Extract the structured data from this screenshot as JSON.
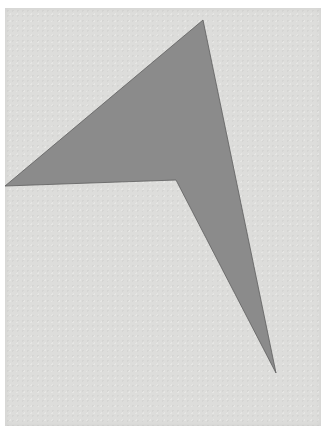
{
  "artwork": {
    "colors": {
      "background": "#ffffff",
      "paper": "#dddddb",
      "shape_fill": "#8b8b8b",
      "shape_edge": "#5e5e5e"
    },
    "shape": {
      "type": "polygon",
      "description": "angular boomerang / arrowhead form",
      "vertices": [
        [
          203,
          20
        ],
        [
          276,
          373
        ],
        [
          176,
          180
        ],
        [
          5,
          186
        ]
      ]
    }
  }
}
